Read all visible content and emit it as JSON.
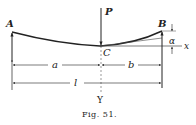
{
  "figure": {
    "caption": "Fig. 51.",
    "labels": {
      "A": "A",
      "B": "B",
      "C": "C",
      "P": "P",
      "x": "x",
      "Y": "Y",
      "alpha": "α",
      "a": "a",
      "b": "b",
      "l": "l"
    },
    "colors": {
      "ink": "#222222",
      "background": "#ffffff"
    }
  }
}
